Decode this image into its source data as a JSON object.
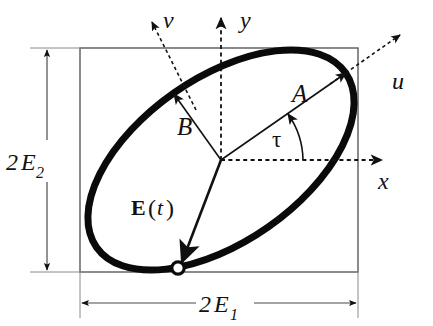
{
  "figure": {
    "background_color": "#ffffff",
    "ink_color": "#111111",
    "ellipse_stroke_color": "#0a0a0a",
    "box_stroke_color": "#5a5a5a",
    "dimension_line_color": "#5a5a5a"
  },
  "labels": {
    "y_axis": "y",
    "x_axis": "x",
    "u_axis": "u",
    "v_axis": "v",
    "semi_major": "A",
    "semi_minor": "B",
    "angle": "τ",
    "field_vector_bold": "E",
    "field_vector_open_paren": "(",
    "field_vector_arg": "t",
    "field_vector_close_paren": ")",
    "height_dimension_prefix": "2",
    "height_dimension_symbol": "E",
    "height_dimension_subscript": "2",
    "width_dimension_prefix": "2",
    "width_dimension_symbol": "E",
    "width_dimension_subscript": "1"
  },
  "geometry": {
    "box": {
      "x": 80,
      "y": 48,
      "width": 278,
      "height": 224
    },
    "center": {
      "x": 221,
      "y": 160
    },
    "ellipse": {
      "semi_major": 152,
      "semi_minor": 82,
      "rotation_deg": -35
    },
    "semi_major_tip": {
      "x": 346,
      "y": 73
    },
    "semi_minor_tip": {
      "x": 174,
      "y": 94
    },
    "field_point": {
      "x": 178,
      "y": 268
    },
    "tau_arc_radius": 82,
    "tau_angle_deg": 35
  },
  "icons": {
    "y_axis_arrow": "arrow-up-icon",
    "x_axis_arrow": "arrow-right-icon",
    "u_axis_arrow": "arrow-up-right-icon",
    "v_axis_arrow": "arrow-up-left-icon",
    "field_marker": "open-circle-marker-icon"
  }
}
